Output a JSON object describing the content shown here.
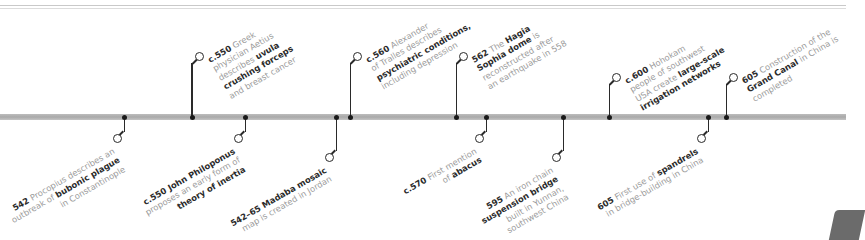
{
  "timeline": {
    "bar_color": "#b0b0b0",
    "marker_color": "#1a1a1a",
    "above": [
      {
        "year": "c.550",
        "lines": [
          [
            "c.550",
            " Greek"
          ],
          [
            "physician Aetius"
          ],
          [
            "describes ",
            "uvula"
          ],
          [
            "crushing forceps"
          ],
          [
            "and breast cancer"
          ]
        ],
        "bold": [
          "c.550",
          "uvula",
          "crushing forceps"
        ]
      },
      {
        "year": "c.560",
        "lines": [
          [
            "c.560",
            " Alexander"
          ],
          [
            "of Tralles describes"
          ],
          [
            "psychiatric conditions,"
          ],
          [
            "including depression"
          ]
        ]
      },
      {
        "year": "562",
        "lines": [
          [
            "562",
            " The ",
            "Hagia"
          ],
          [
            "Sophia dome",
            " is"
          ],
          [
            "reconstructed after"
          ],
          [
            "an earthquake in 558"
          ]
        ]
      },
      {
        "year": "c.600",
        "lines": [
          [
            "c.600",
            " Hohokam"
          ],
          [
            "people of southwest"
          ],
          [
            "USA create ",
            "large-scale"
          ],
          [
            "irrigation networks"
          ]
        ]
      },
      {
        "year": "605",
        "lines": [
          [
            "605",
            " Construction of the"
          ],
          [
            "Grand Canal",
            " in China is"
          ],
          [
            "completed"
          ]
        ]
      }
    ],
    "below": [
      {
        "year": "542",
        "lines": [
          [
            "542",
            " Procopius describes an"
          ],
          [
            "outbreak of ",
            "bubonic plague"
          ],
          [
            "in Constantinople"
          ]
        ]
      },
      {
        "year": "c.550",
        "lines": [
          [
            "c.550 John Philoponus"
          ],
          [
            "proposes an early form of"
          ],
          [
            "theory of inertia"
          ]
        ]
      },
      {
        "year": "542–65",
        "lines": [
          [
            "542–65 Madaba mosaic"
          ],
          [
            "map is created in Jordan"
          ]
        ]
      },
      {
        "year": "c.570",
        "lines": [
          [
            "c.570",
            " First mention"
          ],
          [
            "of ",
            "abacus"
          ]
        ]
      },
      {
        "year": "595",
        "lines": [
          [
            "595",
            " An iron chain"
          ],
          [
            "suspension bridge"
          ],
          [
            "built in Yunnan,"
          ],
          [
            "southwest China"
          ]
        ]
      },
      {
        "year": "605",
        "lines": [
          [
            "605",
            " First use of ",
            "spandrels"
          ],
          [
            "in bridge-building in China"
          ]
        ]
      }
    ]
  },
  "events": {
    "e1": {
      "y": "c.550",
      "t1": " Greek",
      "t2": "physician Aetius",
      "t3a": "describes ",
      "t3b": "uvula",
      "t4": "crushing forceps",
      "t5": "and breast cancer"
    },
    "e2": {
      "y": "c.560",
      "t1": " Alexander",
      "t2": "of Tralles describes",
      "t3": "psychiatric conditions,",
      "t4": "including depression"
    },
    "e3": {
      "y": "562",
      "t1": " The ",
      "t1b": "Hagia",
      "t2": "Sophia dome",
      "t2b": " is",
      "t3": "reconstructed after",
      "t4": "an earthquake in 558"
    },
    "e4": {
      "y": "c.600",
      "t1": " Hohokam",
      "t2": "people of southwest",
      "t3a": "USA create ",
      "t3b": "large-scale",
      "t4": "irrigation networks"
    },
    "e5": {
      "y": "605",
      "t1": " Construction of the",
      "t2": "Grand Canal",
      "t2b": " in China is",
      "t3": "completed"
    },
    "b1": {
      "y": "542",
      "t1": " Procopius describes an",
      "t2a": "outbreak of ",
      "t2b": "bubonic plague",
      "t3": "in Constantinople"
    },
    "b2": {
      "y": "c.550 John Philoponus",
      "t2": "proposes an early form of",
      "t3": "theory of inertia"
    },
    "b3": {
      "y": "542–65 Madaba mosaic",
      "t2": "map is created in Jordan"
    },
    "b4": {
      "y": "c.570",
      "t1": " First mention",
      "t2a": "of ",
      "t2b": "abacus"
    },
    "b5": {
      "y": "595",
      "t1": " An iron chain",
      "t2": "suspension bridge",
      "t3": "built in Yunnan,",
      "t4": "southwest China"
    },
    "b6": {
      "y": "605",
      "t1": " First use of ",
      "t1b": "spandrels",
      "t2": "in bridge-building in China"
    }
  }
}
